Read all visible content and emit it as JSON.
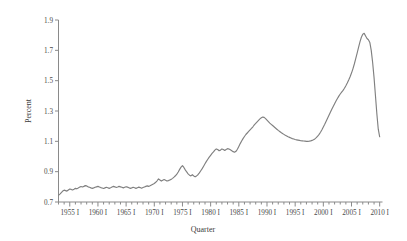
{
  "chart_data": {
    "type": "line",
    "title": "",
    "subtitle": "",
    "xlabel": "Quarter",
    "ylabel": "Percent",
    "grid": false,
    "legend": false,
    "legend_position": "none",
    "line_color": "#808080",
    "axis_color": "#8a8a8a",
    "text_color": "#4a4a4a",
    "ylim": [
      0.7,
      1.9
    ],
    "ytick_labels": [
      "0.7",
      "0.9",
      "1.1",
      "1.3",
      "1.5",
      "1.7",
      "1.9"
    ],
    "ytick_values": [
      0.7,
      0.9,
      1.1,
      1.3,
      1.5,
      1.7,
      1.9
    ],
    "xlim": [
      1953.0,
      2010.5
    ],
    "xtick_labels": [
      "1955 I",
      "1960 I",
      "1965 I",
      "1970 I",
      "1975 I",
      "1980 I",
      "1985 I",
      "1990 I",
      "1995 I",
      "2000 I",
      "2005 I",
      "2010 I"
    ],
    "xtick_values": [
      1955,
      1960,
      1965,
      1970,
      1975,
      1980,
      1985,
      1990,
      1995,
      2000,
      2005,
      2010
    ],
    "minor_xtick_step": 1,
    "x": [
      1953.0,
      1953.25,
      1953.5,
      1953.75,
      1954.0,
      1954.25,
      1954.5,
      1954.75,
      1955.0,
      1955.25,
      1955.5,
      1955.75,
      1956.0,
      1956.25,
      1956.5,
      1956.75,
      1957.0,
      1957.25,
      1957.5,
      1957.75,
      1958.0,
      1958.25,
      1958.5,
      1958.75,
      1959.0,
      1959.25,
      1959.5,
      1959.75,
      1960.0,
      1960.25,
      1960.5,
      1960.75,
      1961.0,
      1961.25,
      1961.5,
      1961.75,
      1962.0,
      1962.25,
      1962.5,
      1962.75,
      1963.0,
      1963.25,
      1963.5,
      1963.75,
      1964.0,
      1964.25,
      1964.5,
      1964.75,
      1965.0,
      1965.25,
      1965.5,
      1965.75,
      1966.0,
      1966.25,
      1966.5,
      1966.75,
      1967.0,
      1967.25,
      1967.5,
      1967.75,
      1968.0,
      1968.25,
      1968.5,
      1968.75,
      1969.0,
      1969.25,
      1969.5,
      1969.75,
      1970.0,
      1970.25,
      1970.5,
      1970.75,
      1971.0,
      1971.25,
      1971.5,
      1971.75,
      1972.0,
      1972.25,
      1972.5,
      1972.75,
      1973.0,
      1973.25,
      1973.5,
      1973.75,
      1974.0,
      1974.25,
      1974.5,
      1974.75,
      1975.0,
      1975.25,
      1975.5,
      1975.75,
      1976.0,
      1976.25,
      1976.5,
      1976.75,
      1977.0,
      1977.25,
      1977.5,
      1977.75,
      1978.0,
      1978.25,
      1978.5,
      1978.75,
      1979.0,
      1979.25,
      1979.5,
      1979.75,
      1980.0,
      1980.25,
      1980.5,
      1980.75,
      1981.0,
      1981.25,
      1981.5,
      1981.75,
      1982.0,
      1982.25,
      1982.5,
      1982.75,
      1983.0,
      1983.25,
      1983.5,
      1983.75,
      1984.0,
      1984.25,
      1984.5,
      1984.75,
      1985.0,
      1985.25,
      1985.5,
      1985.75,
      1986.0,
      1986.25,
      1986.5,
      1986.75,
      1987.0,
      1987.25,
      1987.5,
      1987.75,
      1988.0,
      1988.25,
      1988.5,
      1988.75,
      1989.0,
      1989.25,
      1989.5,
      1989.75,
      1990.0,
      1990.25,
      1990.5,
      1990.75,
      1991.0,
      1991.25,
      1991.5,
      1991.75,
      1992.0,
      1992.25,
      1992.5,
      1992.75,
      1993.0,
      1993.25,
      1993.5,
      1993.75,
      1994.0,
      1994.25,
      1994.5,
      1994.75,
      1995.0,
      1995.25,
      1995.5,
      1995.75,
      1996.0,
      1996.25,
      1996.5,
      1996.75,
      1997.0,
      1997.25,
      1997.5,
      1997.75,
      1998.0,
      1998.25,
      1998.5,
      1998.75,
      1999.0,
      1999.25,
      1999.5,
      1999.75,
      2000.0,
      2000.25,
      2000.5,
      2000.75,
      2001.0,
      2001.25,
      2001.5,
      2001.75,
      2002.0,
      2002.25,
      2002.5,
      2002.75,
      2003.0,
      2003.25,
      2003.5,
      2003.75,
      2004.0,
      2004.25,
      2004.5,
      2004.75,
      2005.0,
      2005.25,
      2005.5,
      2005.75,
      2006.0,
      2006.25,
      2006.5,
      2006.75,
      2007.0,
      2007.25,
      2007.5,
      2007.75,
      2008.0,
      2008.25,
      2008.5,
      2008.75,
      2009.0,
      2009.25,
      2009.5,
      2009.75,
      2010.0
    ],
    "y": [
      0.745,
      0.752,
      0.762,
      0.772,
      0.778,
      0.775,
      0.772,
      0.779,
      0.786,
      0.783,
      0.779,
      0.784,
      0.79,
      0.787,
      0.792,
      0.798,
      0.802,
      0.799,
      0.803,
      0.808,
      0.806,
      0.8,
      0.797,
      0.793,
      0.79,
      0.793,
      0.797,
      0.8,
      0.803,
      0.799,
      0.795,
      0.792,
      0.789,
      0.793,
      0.797,
      0.794,
      0.79,
      0.794,
      0.799,
      0.803,
      0.8,
      0.796,
      0.799,
      0.803,
      0.8,
      0.797,
      0.793,
      0.797,
      0.801,
      0.798,
      0.794,
      0.79,
      0.793,
      0.797,
      0.794,
      0.79,
      0.794,
      0.798,
      0.795,
      0.791,
      0.795,
      0.799,
      0.803,
      0.806,
      0.803,
      0.807,
      0.812,
      0.817,
      0.822,
      0.83,
      0.84,
      0.852,
      0.845,
      0.838,
      0.843,
      0.848,
      0.843,
      0.838,
      0.841,
      0.845,
      0.849,
      0.856,
      0.864,
      0.873,
      0.884,
      0.898,
      0.915,
      0.93,
      0.94,
      0.928,
      0.912,
      0.898,
      0.886,
      0.877,
      0.872,
      0.88,
      0.872,
      0.866,
      0.872,
      0.88,
      0.892,
      0.906,
      0.92,
      0.936,
      0.952,
      0.968,
      0.982,
      0.996,
      1.008,
      1.02,
      1.03,
      1.042,
      1.05,
      1.046,
      1.038,
      1.042,
      1.05,
      1.046,
      1.04,
      1.046,
      1.052,
      1.049,
      1.044,
      1.038,
      1.032,
      1.028,
      1.034,
      1.048,
      1.066,
      1.085,
      1.102,
      1.118,
      1.132,
      1.145,
      1.155,
      1.165,
      1.175,
      1.185,
      1.196,
      1.208,
      1.218,
      1.228,
      1.238,
      1.248,
      1.255,
      1.26,
      1.258,
      1.25,
      1.24,
      1.23,
      1.22,
      1.212,
      1.204,
      1.196,
      1.188,
      1.18,
      1.172,
      1.165,
      1.158,
      1.152,
      1.146,
      1.14,
      1.135,
      1.13,
      1.126,
      1.122,
      1.118,
      1.115,
      1.112,
      1.11,
      1.108,
      1.106,
      1.104,
      1.103,
      1.102,
      1.101,
      1.1,
      1.1,
      1.101,
      1.103,
      1.106,
      1.11,
      1.116,
      1.124,
      1.134,
      1.146,
      1.16,
      1.176,
      1.194,
      1.212,
      1.232,
      1.252,
      1.272,
      1.292,
      1.312,
      1.33,
      1.348,
      1.366,
      1.382,
      1.398,
      1.412,
      1.424,
      1.436,
      1.45,
      1.466,
      1.484,
      1.504,
      1.526,
      1.55,
      1.578,
      1.61,
      1.645,
      1.682,
      1.72,
      1.756,
      1.786,
      1.806,
      1.812,
      1.795,
      1.778,
      1.77,
      1.752,
      1.7,
      1.62,
      1.52,
      1.4,
      1.28,
      1.18,
      1.13,
      1.15,
      1.152
    ],
    "series_name": "Percent",
    "n_points": 229,
    "y_min_observed": 0.745,
    "y_max_observed": 1.812
  },
  "axes": {
    "ylabel": "Percent",
    "xlabel": "Quarter"
  }
}
